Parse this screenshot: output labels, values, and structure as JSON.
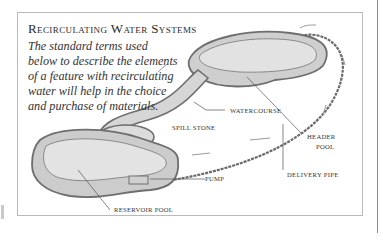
{
  "diagram": {
    "title": "Recirculating Water Systems",
    "intro": "The standard terms used below to describe the elements of a feature with recirculating water will help in the choice and purchase of materials.",
    "labels": {
      "watercourse": "Watercourse",
      "spill_stone": "Spill  Stone",
      "header_pool_line1": "Header",
      "header_pool_line2": "Pool",
      "pump": "Pump",
      "delivery_pipe": "Delivery Pipe",
      "reservoir_pool": "Reservoir Pool"
    },
    "colors": {
      "pool_fill": "#d9d9d9",
      "pool_wall": "#c4c4c4",
      "outline": "#6e6e6e",
      "frame": "#b9b9b9"
    }
  }
}
